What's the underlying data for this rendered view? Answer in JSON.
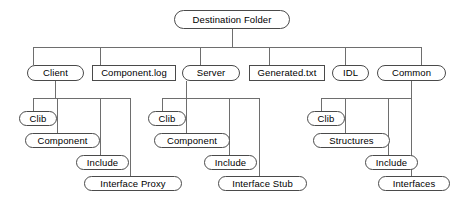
{
  "diagram": {
    "type": "tree",
    "title": "Destination Folder",
    "node_shapes": {
      "folder": "rounded",
      "file": "rectangle"
    },
    "colors": {
      "background": "#ffffff",
      "node_fill": "#ffffff",
      "node_stroke": "#4a4a4a",
      "edge_stroke": "#6e6e6e",
      "text": "#000000"
    }
  },
  "nodes": {
    "root": {
      "label": "Destination Folder",
      "shape": "rounded",
      "x": 174,
      "y": 10,
      "w": 116,
      "h": 19
    },
    "client": {
      "label": "Client",
      "shape": "rounded",
      "x": 27,
      "y": 65,
      "w": 57,
      "h": 16
    },
    "component_log": {
      "label": "Component.log",
      "shape": "rect",
      "x": 92,
      "y": 65,
      "w": 84,
      "h": 16
    },
    "server": {
      "label": "Server",
      "shape": "rounded",
      "x": 182,
      "y": 65,
      "w": 58,
      "h": 16
    },
    "generated_txt": {
      "label": "Generated.txt",
      "shape": "rect",
      "x": 249,
      "y": 65,
      "w": 76,
      "h": 16
    },
    "idl": {
      "label": "IDL",
      "shape": "rounded",
      "x": 332,
      "y": 65,
      "w": 37,
      "h": 16
    },
    "common": {
      "label": "Common",
      "shape": "rounded",
      "x": 377,
      "y": 65,
      "w": 69,
      "h": 16
    },
    "client_clib": {
      "label": "Clib",
      "shape": "rounded",
      "x": 19,
      "y": 111,
      "w": 38,
      "h": 15
    },
    "client_component": {
      "label": "Component",
      "shape": "rounded",
      "x": 25,
      "y": 133,
      "w": 75,
      "h": 15
    },
    "client_include": {
      "label": "Include",
      "shape": "rounded",
      "x": 76,
      "y": 155,
      "w": 53,
      "h": 15
    },
    "client_interface_proxy": {
      "label": "Interface Proxy",
      "shape": "rounded",
      "x": 84,
      "y": 176,
      "w": 98,
      "h": 15
    },
    "server_clib": {
      "label": "Clib",
      "shape": "rounded",
      "x": 148,
      "y": 111,
      "w": 38,
      "h": 15
    },
    "server_component": {
      "label": "Component",
      "shape": "rounded",
      "x": 154,
      "y": 133,
      "w": 76,
      "h": 15
    },
    "server_include": {
      "label": "Include",
      "shape": "rounded",
      "x": 204,
      "y": 155,
      "w": 53,
      "h": 15
    },
    "server_interface_stub": {
      "label": "Interface Stub",
      "shape": "rounded",
      "x": 218,
      "y": 176,
      "w": 89,
      "h": 15
    },
    "common_clib": {
      "label": "Clib",
      "shape": "rounded",
      "x": 307,
      "y": 111,
      "w": 38,
      "h": 15
    },
    "common_structures": {
      "label": "Structures",
      "shape": "rounded",
      "x": 313,
      "y": 133,
      "w": 77,
      "h": 15
    },
    "common_include": {
      "label": "Include",
      "shape": "rounded",
      "x": 365,
      "y": 155,
      "w": 53,
      "h": 15
    },
    "common_interfaces": {
      "label": "Interfaces",
      "shape": "rounded",
      "x": 378,
      "y": 176,
      "w": 72,
      "h": 15
    }
  },
  "edges": [
    {
      "from": "root",
      "to": "client"
    },
    {
      "from": "root",
      "to": "component_log"
    },
    {
      "from": "root",
      "to": "server"
    },
    {
      "from": "root",
      "to": "generated_txt"
    },
    {
      "from": "root",
      "to": "idl"
    },
    {
      "from": "root",
      "to": "common"
    },
    {
      "from": "client",
      "to": "client_clib"
    },
    {
      "from": "client",
      "to": "client_component"
    },
    {
      "from": "client",
      "to": "client_include"
    },
    {
      "from": "client",
      "to": "client_interface_proxy"
    },
    {
      "from": "server",
      "to": "server_clib"
    },
    {
      "from": "server",
      "to": "server_component"
    },
    {
      "from": "server",
      "to": "server_include"
    },
    {
      "from": "server",
      "to": "server_interface_stub"
    },
    {
      "from": "common",
      "to": "common_clib"
    },
    {
      "from": "common",
      "to": "common_structures"
    },
    {
      "from": "common",
      "to": "common_include"
    },
    {
      "from": "common",
      "to": "common_interfaces"
    }
  ],
  "geometry": {
    "root_bus_y": 47,
    "root_stem_x": 232,
    "sub_bus_y": 98,
    "root_bus_x1": 33,
    "root_bus_x2": 421,
    "root_drop_xs": [
      33,
      100,
      200,
      269,
      345,
      421
    ],
    "client_stem_x": 55,
    "client_bus_x1": 33,
    "client_bus_x2": 130,
    "client_drop_xs": [
      33,
      57,
      100,
      130
    ],
    "server_stem_x": 186,
    "server_bus_x1": 162,
    "server_bus_x2": 259,
    "server_drop_xs": [
      162,
      186,
      229,
      259
    ],
    "common_stem_x": 411,
    "common_bus_x1": 321,
    "common_bus_x2": 411,
    "common_drop_xs": [
      321,
      345,
      388,
      411
    ]
  }
}
